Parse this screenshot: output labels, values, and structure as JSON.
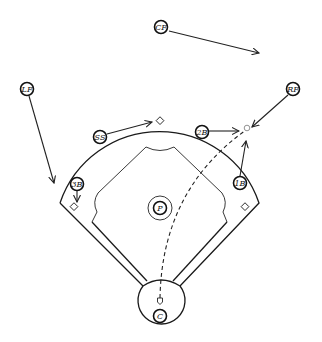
{
  "diagram": {
    "type": "baseball-defensive-positioning",
    "positions": [
      {
        "id": "cf",
        "label": "CF",
        "x": 161,
        "y": 27,
        "arrow_to": [
          259,
          53
        ]
      },
      {
        "id": "lf",
        "label": "LF",
        "x": 27,
        "y": 89,
        "arrow_to": [
          54,
          183
        ]
      },
      {
        "id": "rf",
        "label": "RF",
        "x": 293,
        "y": 89,
        "arrow_to": [
          252,
          129
        ]
      },
      {
        "id": "ss",
        "label": "SS",
        "x": 100,
        "y": 137,
        "arrow_to": [
          152,
          122
        ]
      },
      {
        "id": "2b",
        "label": "2B",
        "x": 202,
        "y": 132,
        "arrow_to": [
          240,
          130
        ]
      },
      {
        "id": "1b",
        "label": "1B",
        "x": 240,
        "y": 183,
        "arrow_to": [
          247,
          141
        ]
      },
      {
        "id": "3b",
        "label": "3B",
        "x": 77,
        "y": 184,
        "arrow_to": [
          77,
          201
        ]
      },
      {
        "id": "p",
        "label": "P",
        "x": 160,
        "y": 208,
        "arrow_to": null
      },
      {
        "id": "c",
        "label": "C",
        "x": 160,
        "y": 315,
        "arrow_to": null
      }
    ],
    "bases": {
      "second": [
        160,
        121
      ],
      "third": [
        74,
        207
      ],
      "first": [
        245,
        207
      ],
      "home": [
        160,
        302
      ]
    },
    "ball": {
      "x": 247,
      "y": 128
    },
    "ball_path": "dashed arc from home plate to shallow right field",
    "colors": {
      "line": "#1a1a1a",
      "background": "#ffffff",
      "ball": "#777777"
    }
  }
}
